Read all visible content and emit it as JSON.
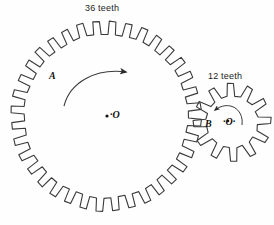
{
  "diagram": {
    "background_color": "#fefefe",
    "stroke_color": "#3a3a3a",
    "text_color": "#1c1c1c"
  },
  "gears": [
    {
      "id": "large-gear",
      "name_label": "A",
      "teeth_label": "36 teeth",
      "teeth_count": 36,
      "center_label": "O",
      "center_marker": "·",
      "center_x": 106,
      "center_y": 116,
      "root_radius": 82,
      "tip_radius": 95,
      "tooth_profile": "square",
      "rotation_arrow": "clockwise"
    },
    {
      "id": "small-gear",
      "name_label": "B",
      "teeth_label": "12 teeth",
      "teeth_count": 12,
      "center_label": "'O'",
      "center_marker": "·",
      "center_x": 232,
      "center_y": 122,
      "root_radius": 26,
      "tip_radius": 39,
      "tooth_profile": "trapezoid",
      "rotation_arrow": "counterclockwise"
    }
  ],
  "labels": {
    "teeth_large": "36 teeth",
    "teeth_small": "12 teeth",
    "gear_a": "A",
    "center_o": "·O",
    "gear_b": "B",
    "center_o_prime": "·O·"
  },
  "arrows": [
    {
      "name": "large-gear-rotation-arrow",
      "belongs_to": "A",
      "direction": "clockwise"
    },
    {
      "name": "small-gear-rotation-arrow",
      "belongs_to": "B",
      "direction": "counterclockwise"
    }
  ]
}
